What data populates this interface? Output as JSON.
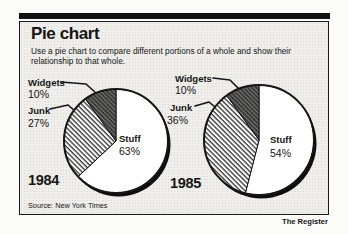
{
  "header": {
    "title": "Pie chart",
    "subtitle": "Use a pie chart to compare different portions of a whole and show their\nrelationship to that whole."
  },
  "footer": {
    "source": "Source: New York Times",
    "credit": "The Register"
  },
  "chart_data": [
    {
      "type": "pie",
      "year": "1984",
      "start_angle_deg": 0,
      "direction": "clockwise",
      "slices": [
        {
          "label": "Stuff",
          "value": 63,
          "display": "63%",
          "pattern": "solid-white"
        },
        {
          "label": "Junk",
          "value": 27,
          "display": "27%",
          "pattern": "diagonal-hatch"
        },
        {
          "label": "Widgets",
          "value": 10,
          "display": "10%",
          "pattern": "dark-crosshatch"
        }
      ]
    },
    {
      "type": "pie",
      "year": "1985",
      "start_angle_deg": 0,
      "direction": "clockwise",
      "slices": [
        {
          "label": "Stuff",
          "value": 54,
          "display": "54%",
          "pattern": "solid-white"
        },
        {
          "label": "Junk",
          "value": 36,
          "display": "36%",
          "pattern": "diagonal-hatch"
        },
        {
          "label": "Widgets",
          "value": 10,
          "display": "10%",
          "pattern": "dark-crosshatch"
        }
      ]
    }
  ],
  "colors": {
    "ink": "#161616",
    "panel_background": "#efeeea",
    "stipple": "#d9d8d2",
    "slice_white": "#ffffff"
  }
}
